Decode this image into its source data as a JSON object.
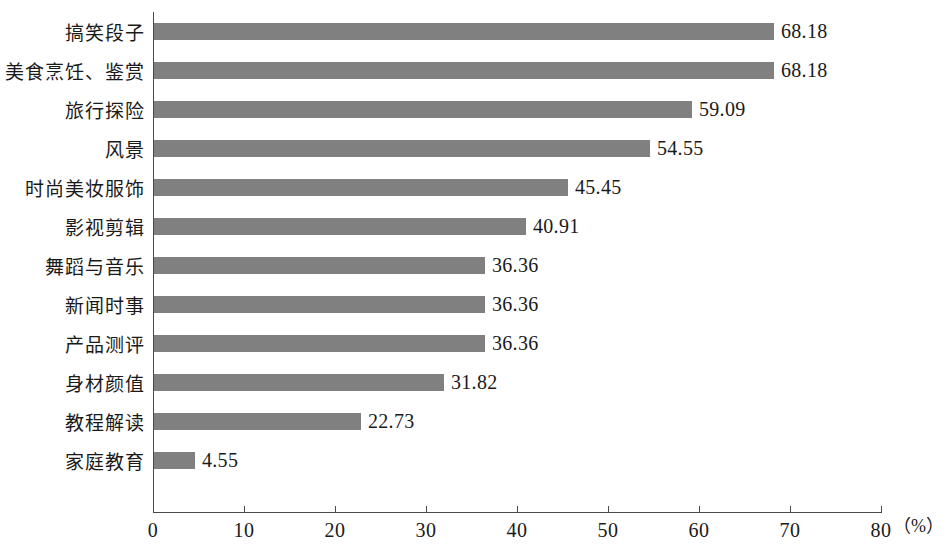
{
  "chart_data": {
    "type": "bar",
    "orientation": "horizontal",
    "title": "",
    "subtitle": "",
    "xlabel": "（%）",
    "ylabel": "",
    "xlim": [
      0,
      80
    ],
    "xticks": [
      0,
      10,
      20,
      30,
      40,
      50,
      60,
      70,
      80
    ],
    "xtick_labels": [
      "0",
      "10",
      "20",
      "30",
      "40",
      "50",
      "60",
      "70",
      "80"
    ],
    "grid": false,
    "legend": null,
    "bar_color": "#808080",
    "axis_color": "#4a4a4a",
    "categories": [
      "搞笑段子",
      "美食烹饪、鉴赏",
      "旅行探险",
      "风景",
      "时尚美妆服饰",
      "影视剪辑",
      "舞蹈与音乐",
      "新闻时事",
      "产品测评",
      "身材颜值",
      "教程解读",
      "家庭教育"
    ],
    "values": [
      68.18,
      68.18,
      59.09,
      54.55,
      45.45,
      40.91,
      36.36,
      36.36,
      36.36,
      31.82,
      22.73,
      4.55
    ],
    "value_labels": [
      "68.18",
      "68.18",
      "59.09",
      "54.55",
      "45.45",
      "40.91",
      "36.36",
      "36.36",
      "36.36",
      "31.82",
      "22.73",
      "4.55"
    ]
  }
}
